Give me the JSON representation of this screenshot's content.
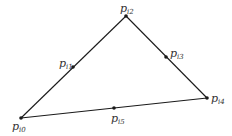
{
  "diagram": {
    "type": "triangle-with-edge-points",
    "stroke_color": "#1a1a1a",
    "points": [
      {
        "id": "p0",
        "base": "p",
        "sub": "i0",
        "x": 21,
        "y": 118,
        "lx": 12,
        "ly": 130
      },
      {
        "id": "p1",
        "base": "p",
        "sub": "i1",
        "x": 73,
        "y": 67,
        "lx": 59,
        "ly": 67
      },
      {
        "id": "p2",
        "base": "p",
        "sub": "i2",
        "x": 126,
        "y": 16,
        "lx": 120,
        "ly": 12
      },
      {
        "id": "p3",
        "base": "p",
        "sub": "i3",
        "x": 166,
        "y": 57,
        "lx": 170,
        "ly": 57
      },
      {
        "id": "p4",
        "base": "p",
        "sub": "i4",
        "x": 207,
        "y": 98,
        "lx": 211,
        "ly": 102
      },
      {
        "id": "p5",
        "base": "p",
        "sub": "i5",
        "x": 114,
        "y": 108,
        "lx": 111,
        "ly": 122
      }
    ],
    "edges": [
      [
        "p0",
        "p2"
      ],
      [
        "p2",
        "p4"
      ],
      [
        "p4",
        "p0"
      ]
    ]
  }
}
